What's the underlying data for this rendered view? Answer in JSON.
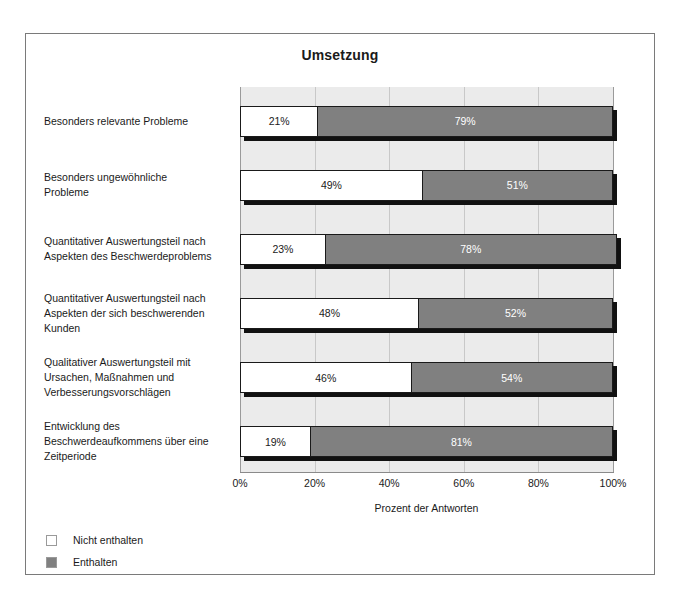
{
  "chart_data": {
    "type": "bar",
    "orientation": "horizontal",
    "stacked": true,
    "title": "Umsetzung",
    "xlabel": "Prozent der Antworten",
    "ylabel": "",
    "xlim": [
      0,
      100
    ],
    "grid": true,
    "legend_position": "bottom-left",
    "tick_labels": [
      "0%",
      "20%",
      "40%",
      "60%",
      "80%",
      "100%"
    ],
    "tick_values": [
      0,
      20,
      40,
      60,
      80,
      100
    ],
    "categories": [
      "Besonders relevante Probleme",
      "Besonders ungewöhnliche Probleme",
      "Quantitativer Auswertungsteil nach Aspekten des Beschwerdeproblems",
      "Quantitativer Auswertungsteil nach Aspekten der sich beschwerenden Kunden",
      "Qualitativer Auswertungsteil mit Ursachen, Maßnahmen und Verbesserungsvorschlägen",
      "Entwicklung des Beschwerdeaufkommens über eine Zeitperiode"
    ],
    "series": [
      {
        "name": "Nicht enthalten",
        "color": "#ffffff",
        "values": [
          21,
          49,
          23,
          48,
          46,
          19
        ],
        "labels": [
          "21%",
          "49%",
          "23%",
          "48%",
          "46%",
          "19%"
        ]
      },
      {
        "name": "Enthalten",
        "color": "#808080",
        "values": [
          79,
          51,
          78,
          52,
          54,
          81
        ],
        "labels": [
          "79%",
          "51%",
          "78%",
          "52%",
          "54%",
          "81%"
        ]
      }
    ]
  },
  "category_lines": [
    [
      "Besonders relevante Probleme"
    ],
    [
      "Besonders ungewöhnliche",
      "Probleme"
    ],
    [
      "Quantitativer Auswertungsteil nach",
      "Aspekten des Beschwerdeproblems"
    ],
    [
      "Quantitativer Auswertungsteil nach",
      "Aspekten der sich beschwerenden",
      "Kunden"
    ],
    [
      "Qualitativer Auswertungsteil mit",
      "Ursachen, Maßnahmen und",
      "Verbesserungsvorschlägen"
    ],
    [
      "Entwicklung des",
      "Beschwerdeaufkommens über eine",
      "Zeitperiode"
    ]
  ],
  "legend": {
    "items": [
      {
        "label": "Nicht enthalten",
        "color": "#ffffff"
      },
      {
        "label": "Enthalten",
        "color": "#808080"
      }
    ]
  }
}
